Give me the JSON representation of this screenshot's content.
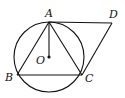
{
  "diagram": {
    "type": "geometry",
    "points": {
      "A": {
        "label": "A",
        "x": 49,
        "y": 22
      },
      "B": {
        "label": "B",
        "x": 17,
        "y": 75
      },
      "C": {
        "label": "C",
        "x": 82,
        "y": 75
      },
      "D": {
        "label": "D",
        "x": 112,
        "y": 23
      },
      "O": {
        "label": "O",
        "x": 49,
        "y": 57
      }
    },
    "circle": {
      "center": "O",
      "radius": 35
    },
    "segments": [
      [
        "A",
        "B"
      ],
      [
        "A",
        "C"
      ],
      [
        "B",
        "C"
      ],
      [
        "A",
        "D"
      ],
      [
        "C",
        "D"
      ],
      [
        "A",
        "O"
      ]
    ],
    "stroke_color": "#111111"
  }
}
